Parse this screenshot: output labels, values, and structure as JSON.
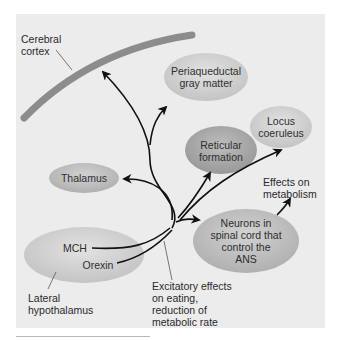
{
  "diagram": {
    "colors": {
      "panel_bg": "#ececec",
      "cortex": "#8c8c8c",
      "ellipse_light": "#cfcfcf",
      "ellipse_dark": "#a8a8a8",
      "arrow": "#111111",
      "leader_line": "#555555"
    },
    "labels": {
      "cerebral_cortex": "Cerebral\ncortex",
      "lateral_hypothalamus": "Lateral\nhypothalamus",
      "excitatory_effects": "Excitatory effects\non eating,\nreduction of\nmetabolic rate",
      "effects_on_metabolism": "Effects on\nmetabolism"
    },
    "nodes": {
      "periaqueductal": "Periaqueductal\ngray matter",
      "locus_coeruleus": "Locus\ncoeruleus",
      "reticular_formation": "Reticular\nformation",
      "thalamus": "Thalamus",
      "spinal_neurons": "Neurons in\nspinal cord that\ncontrol the\nANS",
      "mch": "MCH",
      "orexin": "Orexin"
    },
    "edges": [
      {
        "from": "Lateral hypothalamus",
        "to": "Cerebral cortex"
      },
      {
        "from": "Lateral hypothalamus",
        "to": "Periaqueductal gray matter"
      },
      {
        "from": "Lateral hypothalamus",
        "to": "Thalamus"
      },
      {
        "from": "Lateral hypothalamus",
        "to": "Reticular formation"
      },
      {
        "from": "Lateral hypothalamus",
        "to": "Locus coeruleus"
      },
      {
        "from": "Lateral hypothalamus",
        "to": "Neurons in spinal cord that control the ANS"
      },
      {
        "from": "Neurons in spinal cord that control the ANS",
        "to": "Effects on metabolism"
      }
    ]
  }
}
